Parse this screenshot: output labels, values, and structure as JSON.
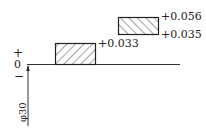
{
  "diagram": {
    "type": "tolerance-zone-diagram",
    "basic_size_label": "φ30",
    "zero_line_label": "0",
    "plus_label": "+",
    "minus_label": "−",
    "zones": [
      {
        "name": "hole",
        "upper": "+0.033",
        "lower": "0",
        "hatch": "forward"
      },
      {
        "name": "shaft",
        "upper": "+0.056",
        "lower": "+0.035",
        "hatch": "backward"
      }
    ],
    "labels": {
      "hole_upper": "+0.033",
      "shaft_upper": "+0.056",
      "shaft_lower": "+0.035"
    },
    "colors": {
      "line": "#222222",
      "background": "#ffffff"
    }
  }
}
